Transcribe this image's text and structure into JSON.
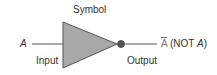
{
  "diagram": {
    "title": "Symbol",
    "input_variable": "A",
    "input_label": "Input",
    "output_label": "Output",
    "output_expression": {
      "complement_symbol": "A",
      "paren_open": "(NOT ",
      "variable": "A",
      "paren_close": ")"
    },
    "gate_type": "NOT",
    "colors": {
      "gate_fill": "#a8a8a8",
      "stroke": "#555555",
      "bubble_fill": "#555555",
      "text": "#333333"
    }
  }
}
